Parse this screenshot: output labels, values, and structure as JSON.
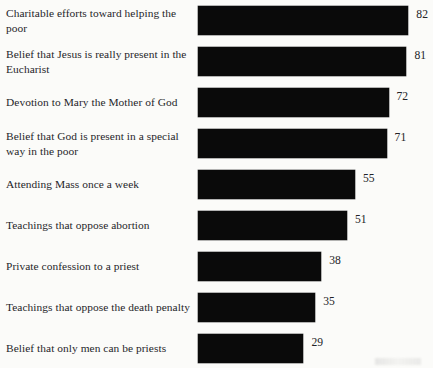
{
  "chart_data": {
    "type": "bar",
    "orientation": "horizontal",
    "title": "",
    "subtitle": "",
    "xlabel": "",
    "ylabel": "",
    "grid": false,
    "legend": false,
    "value_suffix": "",
    "xlim": [
      0,
      100
    ],
    "categories": [
      "Charitable efforts toward helping the poor",
      "Belief that Jesus is really present in the Eucharist",
      "Devotion to Mary the Mother of God",
      "Belief that God is present in a special way in the poor",
      "Attending Mass once a week",
      "Teachings that oppose abortion",
      "Private confession to a priest",
      "Teachings that oppose the death penalty",
      "Belief that only men can be priests"
    ],
    "values": [
      82,
      81,
      72,
      71,
      55,
      51,
      38,
      35,
      29
    ],
    "value_labels": [
      "82",
      "81",
      "72",
      "71",
      "55",
      "51",
      "38",
      "35",
      "29"
    ],
    "bar_color": "#0a0a0a",
    "background_color": "#fbfbf9",
    "text_color": "#26262a"
  }
}
